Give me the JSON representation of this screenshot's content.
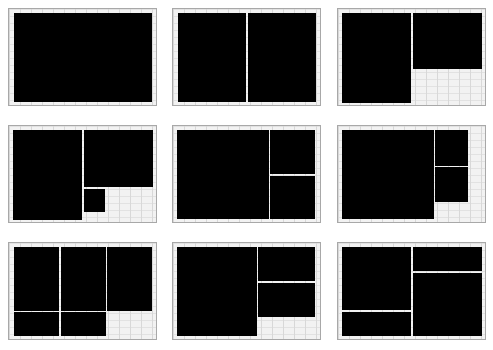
{
  "layouts": [
    {
      "id": "1",
      "x": 8,
      "y": 8,
      "w": 149,
      "h": 98,
      "panes": [
        [
          5,
          4,
          138,
          89
        ]
      ]
    },
    {
      "id": "2",
      "x": 172,
      "y": 8,
      "w": 149,
      "h": 98,
      "panes": [
        [
          5,
          4,
          68,
          89
        ],
        [
          75,
          4,
          68,
          89
        ]
      ]
    },
    {
      "id": "3",
      "x": 337,
      "y": 8,
      "w": 149,
      "h": 98,
      "panes": [
        [
          4,
          4,
          69,
          90
        ],
        [
          75,
          4,
          69,
          56
        ]
      ]
    },
    {
      "id": "4",
      "x": 8,
      "y": 125,
      "w": 149,
      "h": 98,
      "panes": [
        [
          4,
          4,
          69,
          90
        ],
        [
          75,
          4,
          69,
          57
        ],
        [
          75,
          63,
          21,
          23
        ]
      ]
    },
    {
      "id": "5",
      "x": 172,
      "y": 125,
      "w": 149,
      "h": 98,
      "panes": [
        [
          4,
          4,
          92,
          89
        ],
        [
          97,
          4,
          45,
          44
        ],
        [
          97,
          50,
          45,
          43
        ]
      ]
    },
    {
      "id": "6",
      "x": 337,
      "y": 125,
      "w": 149,
      "h": 98,
      "panes": [
        [
          4,
          4,
          92,
          89
        ],
        [
          97,
          4,
          33,
          36
        ],
        [
          97,
          41,
          33,
          35
        ]
      ]
    },
    {
      "id": "7",
      "x": 8,
      "y": 242,
      "w": 149,
      "h": 98,
      "panes": [
        [
          5,
          4,
          45,
          64
        ],
        [
          52,
          4,
          45,
          64
        ],
        [
          98,
          4,
          45,
          64
        ],
        [
          5,
          69,
          45,
          24
        ],
        [
          52,
          69,
          45,
          24
        ]
      ]
    },
    {
      "id": "8",
      "x": 172,
      "y": 242,
      "w": 149,
      "h": 98,
      "panes": [
        [
          4,
          4,
          80,
          89
        ],
        [
          85,
          4,
          57,
          34
        ],
        [
          85,
          40,
          57,
          34
        ]
      ]
    },
    {
      "id": "9",
      "x": 337,
      "y": 242,
      "w": 149,
      "h": 98,
      "panes": [
        [
          4,
          4,
          69,
          63
        ],
        [
          4,
          69,
          69,
          24
        ],
        [
          75,
          4,
          69,
          24
        ],
        [
          75,
          30,
          69,
          63
        ]
      ]
    }
  ]
}
